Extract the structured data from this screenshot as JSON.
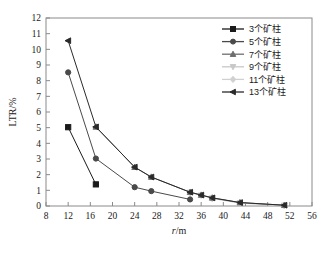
{
  "chart_data": {
    "type": "line",
    "title": "",
    "subtitle": "",
    "xlabel": "r/m",
    "xlabel_italic_part": "r",
    "xlabel_rest": "/m",
    "ylabel": "LTR/%",
    "xlim": [
      8,
      56
    ],
    "ylim": [
      0,
      12
    ],
    "xticks": [
      8,
      12,
      16,
      20,
      24,
      28,
      32,
      36,
      40,
      44,
      48,
      52,
      56
    ],
    "yticks": [
      0,
      1,
      2,
      3,
      4,
      5,
      6,
      7,
      8,
      9,
      10,
      11,
      12
    ],
    "grid": false,
    "legend_position": "top-right",
    "series": [
      {
        "name": "3个矿柱",
        "marker": "square",
        "color": "#1a1a1a",
        "x": [
          12,
          17
        ],
        "y": [
          5.03,
          1.38
        ]
      },
      {
        "name": "5个矿柱",
        "marker": "circle",
        "color": "#4a4a4a",
        "x": [
          12,
          17,
          24,
          27,
          34
        ],
        "y": [
          8.53,
          3.03,
          1.2,
          0.95,
          0.42
        ]
      },
      {
        "name": "7个矿柱",
        "marker": "triangle-up",
        "color": "#6e6e6e",
        "x": [
          17,
          24,
          27,
          34,
          36,
          38,
          43,
          51
        ],
        "y": [
          5.05,
          2.48,
          1.85,
          0.88,
          0.7,
          0.52,
          0.22,
          0.05
        ]
      },
      {
        "name": "9个矿柱",
        "marker": "triangle-down",
        "color": "#c8c8c8",
        "x": [
          34,
          36,
          38,
          43,
          51
        ],
        "y": [
          0.86,
          0.68,
          0.5,
          0.2,
          0.04
        ]
      },
      {
        "name": "11个矿柱",
        "marker": "diamond",
        "color": "#d0d0d0",
        "x": [
          38,
          43,
          51
        ],
        "y": [
          0.48,
          0.18,
          0.03
        ]
      },
      {
        "name": "13个矿柱",
        "marker": "triangle-left",
        "color": "#2a2a2a",
        "x": [
          12,
          17,
          24,
          27,
          34,
          36,
          38,
          43,
          51
        ],
        "y": [
          10.55,
          5.05,
          2.48,
          1.85,
          0.88,
          0.7,
          0.52,
          0.22,
          0.05
        ]
      }
    ]
  },
  "legend": {
    "items": [
      {
        "label": "3个矿柱",
        "marker": "square",
        "color": "#1a1a1a"
      },
      {
        "label": "5个矿柱",
        "marker": "circle",
        "color": "#4a4a4a"
      },
      {
        "label": "7个矿柱",
        "marker": "triangle-up",
        "color": "#6e6e6e"
      },
      {
        "label": "9个矿柱",
        "marker": "triangle-down",
        "color": "#c8c8c8"
      },
      {
        "label": "11个矿柱",
        "marker": "diamond",
        "color": "#d0d0d0"
      },
      {
        "label": "13个矿柱",
        "marker": "triangle-left",
        "color": "#2a2a2a"
      }
    ]
  },
  "axes": {
    "x_tick_labels": [
      "8",
      "12",
      "16",
      "20",
      "24",
      "28",
      "32",
      "36",
      "40",
      "44",
      "48",
      "52",
      "56"
    ],
    "y_tick_labels": [
      "0",
      "1",
      "2",
      "3",
      "4",
      "5",
      "6",
      "7",
      "8",
      "9",
      "10",
      "11",
      "12"
    ],
    "x_title": "r/m",
    "y_title": "LTR/%"
  },
  "colors": {
    "axis": "#8a8a8a",
    "text": "#1a1a1a",
    "background": "#ffffff"
  }
}
